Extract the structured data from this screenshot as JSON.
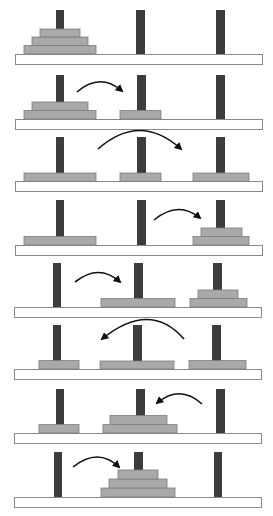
{
  "colors": {
    "peg": "#3c3c3c",
    "disk": "#a9a9a9",
    "disk_border": "#7d7d7d",
    "base_fill": "#ffffff",
    "base_border": "#8a8a8a",
    "arrow": "#111111"
  },
  "pegs": [
    "A",
    "B",
    "C"
  ],
  "disks": [
    "small",
    "medium",
    "large"
  ],
  "steps": [
    {
      "step": 0,
      "state": {
        "A": [
          "large",
          "medium",
          "small"
        ],
        "B": [],
        "C": []
      },
      "move": null
    },
    {
      "step": 1,
      "state": {
        "A": [
          "large",
          "medium"
        ],
        "B": [
          "small"
        ],
        "C": []
      },
      "move": {
        "from": "A",
        "to": "B"
      }
    },
    {
      "step": 2,
      "state": {
        "A": [
          "large"
        ],
        "B": [
          "small"
        ],
        "C": [
          "medium"
        ]
      },
      "move": {
        "from": "A",
        "to": "C"
      }
    },
    {
      "step": 3,
      "state": {
        "A": [
          "large"
        ],
        "B": [],
        "C": [
          "medium",
          "small"
        ]
      },
      "move": {
        "from": "B",
        "to": "C"
      }
    },
    {
      "step": 4,
      "state": {
        "A": [],
        "B": [
          "large"
        ],
        "C": [
          "medium",
          "small"
        ]
      },
      "move": {
        "from": "A",
        "to": "B"
      }
    },
    {
      "step": 5,
      "state": {
        "A": [
          "small"
        ],
        "B": [
          "large"
        ],
        "C": [
          "medium"
        ]
      },
      "move": {
        "from": "C",
        "to": "A"
      }
    },
    {
      "step": 6,
      "state": {
        "A": [
          "small"
        ],
        "B": [
          "large",
          "medium"
        ],
        "C": []
      },
      "move": {
        "from": "C",
        "to": "B"
      }
    },
    {
      "step": 7,
      "state": {
        "A": [],
        "B": [
          "large",
          "medium",
          "small"
        ],
        "C": []
      },
      "move": {
        "from": "A",
        "to": "B"
      }
    }
  ]
}
